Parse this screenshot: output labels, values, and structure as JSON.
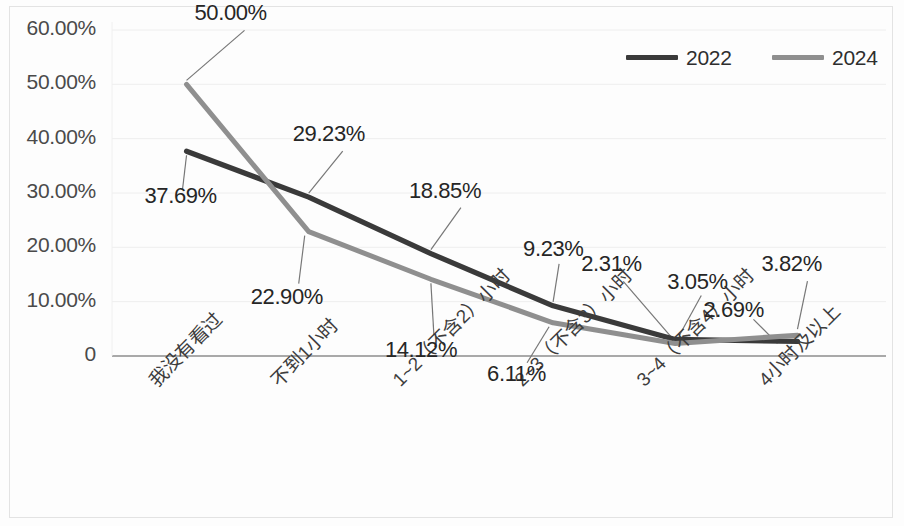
{
  "chart_data": {
    "type": "line",
    "title": "",
    "xlabel": "",
    "ylabel": "",
    "ylim": [
      0,
      60
    ],
    "grid": true,
    "legend_position": "top-right",
    "categories": [
      "我没有看过",
      "不到1小时",
      "1~2（不含2）小时",
      "2~3（不含3）小时",
      "3~4（不含4）小时",
      "4小时及以上"
    ],
    "ytick_labels": [
      "0",
      "10.00%",
      "20.00%",
      "30.00%",
      "40.00%",
      "50.00%",
      "60.00%"
    ],
    "ytick_values": [
      0,
      10,
      20,
      30,
      40,
      50,
      60
    ],
    "series": [
      {
        "name": "2022",
        "color": "#3a3a3a",
        "values": [
          37.69,
          29.23,
          18.85,
          9.23,
          3.05,
          2.69
        ],
        "labels": [
          "37.69%",
          "29.23%",
          "18.85%",
          "9.23%",
          "3.05%",
          "2.69%"
        ]
      },
      {
        "name": "2024",
        "color": "#8f8f8f",
        "values": [
          50.0,
          22.9,
          14.12,
          6.11,
          2.31,
          3.82
        ],
        "labels": [
          "50.00%",
          "22.90%",
          "14.12%",
          "6.11%",
          "2.31%",
          "3.82%"
        ]
      }
    ]
  },
  "legend": {
    "items": [
      {
        "label": "2022",
        "color": "#3a3a3a"
      },
      {
        "label": "2024",
        "color": "#8f8f8f"
      }
    ]
  },
  "data_labels": [
    {
      "text": "50.00%",
      "series": "2024",
      "category_index": 0
    },
    {
      "text": "37.69%",
      "series": "2022",
      "category_index": 0
    },
    {
      "text": "29.23%",
      "series": "2022",
      "category_index": 1
    },
    {
      "text": "22.90%",
      "series": "2024",
      "category_index": 1
    },
    {
      "text": "18.85%",
      "series": "2022",
      "category_index": 2
    },
    {
      "text": "14.12%",
      "series": "2024",
      "category_index": 2
    },
    {
      "text": "9.23%",
      "series": "2022",
      "category_index": 3
    },
    {
      "text": "6.11%",
      "series": "2024",
      "category_index": 3
    },
    {
      "text": "2.31%",
      "series": "2024",
      "category_index": 4
    },
    {
      "text": "3.05%",
      "series": "2022",
      "category_index": 4
    },
    {
      "text": "2.69%",
      "series": "2022",
      "category_index": 5
    },
    {
      "text": "3.82%",
      "series": "2024",
      "category_index": 5
    }
  ]
}
